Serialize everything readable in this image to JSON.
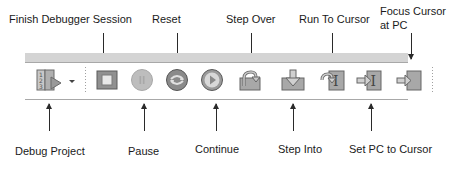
{
  "top_labels": [
    {
      "id": "finish",
      "text": "Finish Debugger Session"
    },
    {
      "id": "reset",
      "text": "Reset"
    },
    {
      "id": "step_over",
      "text": "Step Over"
    },
    {
      "id": "run_to_cursor",
      "text": "Run To Cursor"
    },
    {
      "id": "focus_line1",
      "text": "Focus Cursor"
    },
    {
      "id": "focus_line2",
      "text": "at PC"
    }
  ],
  "bottom_labels": [
    {
      "id": "debug_project",
      "text": "Debug Project"
    },
    {
      "id": "pause",
      "text": "Pause"
    },
    {
      "id": "continue",
      "text": "Continue"
    },
    {
      "id": "step_into",
      "text": "Step Into"
    },
    {
      "id": "set_pc",
      "text": "Set PC to Cursor"
    }
  ],
  "toolbar": {
    "buttons": [
      {
        "name": "debug-project",
        "icon": "debug-project-icon",
        "state": "enabled"
      },
      {
        "name": "debug-project-dropdown",
        "icon": "chevron-down-icon",
        "state": "enabled"
      },
      {
        "name": "finish-debugger-session",
        "icon": "stop-square-icon",
        "state": "enabled"
      },
      {
        "name": "pause",
        "icon": "pause-icon",
        "state": "disabled"
      },
      {
        "name": "reset",
        "icon": "reset-icon",
        "state": "enabled"
      },
      {
        "name": "continue",
        "icon": "play-icon",
        "state": "enabled"
      },
      {
        "name": "step-over",
        "icon": "step-over-icon",
        "state": "enabled"
      },
      {
        "name": "step-into",
        "icon": "step-into-icon",
        "state": "enabled"
      },
      {
        "name": "run-to-cursor",
        "icon": "run-to-cursor-icon",
        "state": "enabled"
      },
      {
        "name": "set-pc-to-cursor",
        "icon": "set-pc-icon",
        "state": "enabled"
      },
      {
        "name": "focus-cursor-at-pc",
        "icon": "focus-cursor-icon",
        "state": "enabled"
      }
    ]
  },
  "colors": {
    "icon_fill": "#b8b8b8",
    "icon_stroke": "#6a6a6a",
    "toolbar_strip": "#d4d4d4",
    "text": "#1a1a1a"
  }
}
